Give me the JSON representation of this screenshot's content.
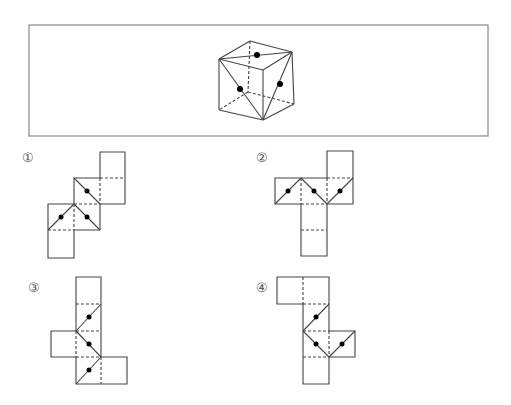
{
  "question_box": {
    "x": 29,
    "y": 25,
    "w": 459,
    "h": 111,
    "stroke": "#888888"
  },
  "cube": {
    "vertices": {
      "top_back": [
        250,
        41
      ],
      "top_left": [
        219,
        59
      ],
      "top_right": [
        292,
        52
      ],
      "top_front": [
        263,
        70
      ],
      "bottom_left": [
        219,
        110
      ],
      "bottom_front": [
        263,
        120
      ],
      "bottom_right": [
        294,
        104
      ],
      "bottom_back": [
        248,
        92
      ]
    },
    "solid_edges": [
      [
        "top_back",
        "top_left"
      ],
      [
        "top_back",
        "top_right"
      ],
      [
        "top_left",
        "top_front"
      ],
      [
        "top_right",
        "top_front"
      ],
      [
        "top_left",
        "bottom_left"
      ],
      [
        "top_front",
        "bottom_front"
      ],
      [
        "top_right",
        "bottom_right"
      ],
      [
        "bottom_left",
        "bottom_front"
      ],
      [
        "bottom_front",
        "bottom_right"
      ],
      [
        "top_left",
        "top_right"
      ],
      [
        "top_left",
        "bottom_front"
      ],
      [
        "top_right",
        "bottom_front"
      ]
    ],
    "hidden_edges": [
      [
        "top_back",
        "bottom_back"
      ],
      [
        "bottom_back",
        "bottom_left"
      ],
      [
        "bottom_back",
        "bottom_right"
      ]
    ],
    "dots": [
      [
        257,
        55
      ],
      [
        240,
        89
      ],
      [
        280,
        84
      ]
    ]
  },
  "options": [
    {
      "label": "①",
      "label_pos": [
        22,
        150
      ],
      "solid": [
        [
          100,
          152,
          125,
          152
        ],
        [
          125,
          152,
          125,
          204
        ],
        [
          125,
          204,
          74,
          204
        ],
        [
          74,
          204,
          74,
          230
        ],
        [
          74,
          230,
          74,
          258
        ],
        [
          74,
          258,
          48,
          258
        ],
        [
          48,
          258,
          48,
          178
        ],
        [
          48,
          178,
          74,
          178
        ],
        [
          74,
          178,
          74,
          152
        ],
        [
          74,
          152,
          100,
          152
        ],
        [
          100,
          152,
          100,
          178
        ],
        [
          74,
          178,
          74,
          178
        ],
        [
          74,
          178,
          100,
          178
        ]
      ],
      "outline": [
        [
          100,
          152
        ],
        [
          125,
          152
        ],
        [
          125,
          204
        ],
        [
          100,
          204
        ],
        [
          100,
          230
        ],
        [
          74,
          230
        ],
        [
          74,
          258
        ],
        [
          48,
          258
        ],
        [
          48,
          204
        ],
        [
          74,
          204
        ],
        [
          74,
          178
        ],
        [
          100,
          178
        ]
      ],
      "dashed": [
        [
          100,
          178,
          125,
          178
        ],
        [
          100,
          178,
          100,
          204
        ],
        [
          74,
          204,
          100,
          204
        ],
        [
          74,
          204,
          74,
          230
        ],
        [
          48,
          230,
          74,
          230
        ]
      ],
      "diagonals": [
        [
          74,
          178,
          100,
          204
        ],
        [
          74,
          204,
          48,
          230
        ],
        [
          74,
          204,
          100,
          230
        ]
      ],
      "dots": [
        [
          87,
          191
        ],
        [
          61,
          217
        ],
        [
          87,
          217
        ]
      ]
    },
    {
      "label": "②",
      "label_pos": [
        256,
        150
      ],
      "outline": [
        [
          327,
          151
        ],
        [
          353,
          151
        ],
        [
          353,
          204
        ],
        [
          327,
          204
        ],
        [
          327,
          256
        ],
        [
          301,
          256
        ],
        [
          301,
          204
        ],
        [
          275,
          204
        ],
        [
          275,
          178
        ],
        [
          327,
          178
        ]
      ],
      "dashed": [
        [
          327,
          178,
          353,
          178
        ],
        [
          301,
          178,
          301,
          204
        ],
        [
          301,
          204,
          327,
          204
        ],
        [
          327,
          178,
          327,
          204
        ],
        [
          301,
          230,
          327,
          230
        ]
      ],
      "diagonals": [
        [
          275,
          204,
          301,
          178
        ],
        [
          301,
          178,
          327,
          204
        ],
        [
          327,
          204,
          353,
          178
        ]
      ],
      "dots": [
        [
          288,
          191
        ],
        [
          314,
          191
        ],
        [
          340,
          191
        ]
      ]
    },
    {
      "label": "③",
      "label_pos": [
        28,
        280
      ],
      "outline": [
        [
          76,
          277
        ],
        [
          101,
          277
        ],
        [
          101,
          357
        ],
        [
          127,
          357
        ],
        [
          127,
          384
        ],
        [
          76,
          384
        ],
        [
          76,
          357
        ],
        [
          51,
          357
        ],
        [
          51,
          331
        ],
        [
          76,
          331
        ]
      ],
      "dashed": [
        [
          76,
          304,
          101,
          304
        ],
        [
          76,
          331,
          101,
          331
        ],
        [
          76,
          357,
          101,
          357
        ],
        [
          76,
          331,
          76,
          357
        ],
        [
          101,
          357,
          101,
          384
        ]
      ],
      "diagonals": [
        [
          76,
          331,
          101,
          304
        ],
        [
          76,
          331,
          101,
          357
        ],
        [
          76,
          384,
          101,
          357
        ]
      ],
      "dots": [
        [
          89,
          317
        ],
        [
          89,
          344
        ],
        [
          89,
          370
        ]
      ]
    },
    {
      "label": "④",
      "label_pos": [
        256,
        280
      ],
      "outline": [
        [
          277,
          277
        ],
        [
          329,
          277
        ],
        [
          329,
          331
        ],
        [
          355,
          331
        ],
        [
          355,
          357
        ],
        [
          329,
          357
        ],
        [
          329,
          384
        ],
        [
          303,
          384
        ],
        [
          303,
          304
        ],
        [
          277,
          304
        ]
      ],
      "dashed": [
        [
          303,
          277,
          303,
          304
        ],
        [
          303,
          304,
          329,
          304
        ],
        [
          303,
          331,
          329,
          331
        ],
        [
          329,
          331,
          329,
          357
        ],
        [
          303,
          357,
          329,
          357
        ]
      ],
      "diagonals": [
        [
          303,
          331,
          329,
          304
        ],
        [
          303,
          331,
          329,
          357
        ],
        [
          329,
          357,
          355,
          331
        ]
      ],
      "dots": [
        [
          316,
          317
        ],
        [
          316,
          344
        ],
        [
          342,
          344
        ]
      ]
    }
  ]
}
